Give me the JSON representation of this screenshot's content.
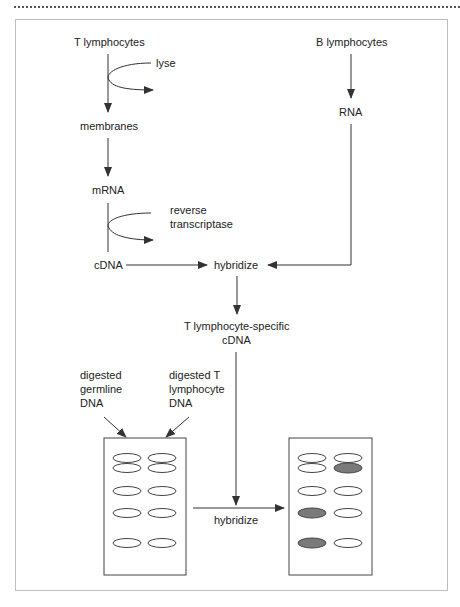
{
  "figure": {
    "nodes": {
      "t_lymphocytes": "T lymphocytes",
      "b_lymphocytes": "B lymphocytes",
      "lyse": "lyse",
      "membranes": "membranes",
      "mrna": "mRNA",
      "reverse_transcriptase_1": "reverse",
      "reverse_transcriptase_2": "transcriptase",
      "cdna": "cDNA",
      "rna": "RNA",
      "hybridize_top": "hybridize",
      "t_specific_1": "T lymphocyte-specific",
      "t_specific_2": "cDNA",
      "germline_1": "digested",
      "germline_2": "germline",
      "germline_3": "DNA",
      "tdna_1": "digested T",
      "tdna_2": "lymphocyte",
      "tdna_3": "DNA",
      "hybridize_bottom": "hybridize"
    },
    "blots": {
      "left_blot": {
        "lanes": [
          "germline",
          "T lymphocyte"
        ],
        "bands": [
          {
            "lane": 1,
            "row": 1,
            "filled": false
          },
          {
            "lane": 2,
            "row": 1,
            "filled": false
          },
          {
            "lane": 1,
            "row": 2,
            "filled": false
          },
          {
            "lane": 2,
            "row": 2,
            "filled": false
          },
          {
            "lane": 1,
            "row": 3,
            "filled": false
          },
          {
            "lane": 2,
            "row": 3,
            "filled": false
          },
          {
            "lane": 1,
            "row": 4,
            "filled": false
          },
          {
            "lane": 2,
            "row": 4,
            "filled": false
          },
          {
            "lane": 1,
            "row": 5,
            "filled": false
          },
          {
            "lane": 2,
            "row": 5,
            "filled": false
          }
        ]
      },
      "right_blot": {
        "bands": [
          {
            "lane": 1,
            "row": 1,
            "filled": false
          },
          {
            "lane": 2,
            "row": 1,
            "filled": false
          },
          {
            "lane": 1,
            "row": 2,
            "filled": false
          },
          {
            "lane": 2,
            "row": 2,
            "filled": true
          },
          {
            "lane": 1,
            "row": 3,
            "filled": false
          },
          {
            "lane": 2,
            "row": 3,
            "filled": false
          },
          {
            "lane": 1,
            "row": 4,
            "filled": true
          },
          {
            "lane": 2,
            "row": 4,
            "filled": false
          },
          {
            "lane": 1,
            "row": 5,
            "filled": true
          },
          {
            "lane": 2,
            "row": 5,
            "filled": false
          }
        ],
        "filled_color": "#7a7a7a"
      }
    }
  }
}
